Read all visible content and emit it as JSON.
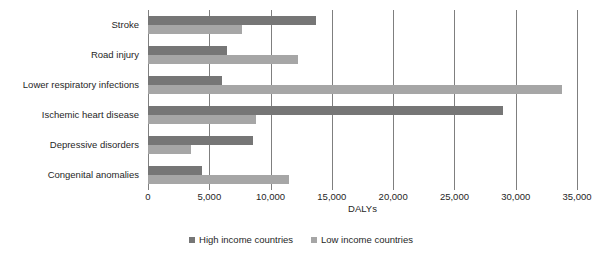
{
  "chart_data": {
    "type": "bar",
    "orientation": "horizontal",
    "title": "",
    "xlabel": "DALYs",
    "ylabel": "",
    "xlim": [
      0,
      35000
    ],
    "xticks": [
      0,
      5000,
      10000,
      15000,
      20000,
      25000,
      30000,
      35000
    ],
    "xtick_labels": [
      "0",
      "5,000",
      "10,000",
      "15,000",
      "20,000",
      "25,000",
      "30,000",
      "35,000"
    ],
    "grid": true,
    "legend_position": "bottom",
    "categories": [
      "Stroke",
      "Road injury",
      "Lower respiratory infections",
      "Ischemic heart disease",
      "Depressive disorders",
      "Congenital anomalies"
    ],
    "series": [
      {
        "name": "High income countries",
        "color": "#767676",
        "values": [
          13700,
          6450,
          6050,
          29000,
          8600,
          4400
        ]
      },
      {
        "name": "Low income countries",
        "color": "#a6a6a6",
        "values": [
          7700,
          12200,
          33800,
          8800,
          3500,
          11500
        ]
      }
    ]
  },
  "legend": {
    "items": [
      {
        "label": "High income countries",
        "color": "#767676"
      },
      {
        "label": "Low income countries",
        "color": "#a6a6a6"
      }
    ]
  },
  "axis": {
    "x_title": "DALYs"
  },
  "colors": {
    "high_income": "#767676",
    "low_income": "#a6a6a6",
    "gridline": "#7f7f7f",
    "text": "#262626",
    "background": "#ffffff"
  }
}
